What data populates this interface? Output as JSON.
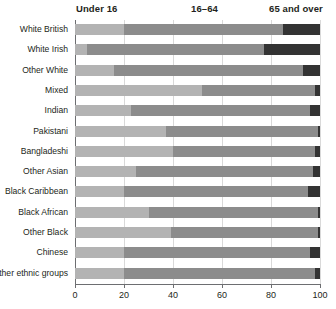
{
  "chart_data": {
    "type": "bar",
    "orientation": "horizontal",
    "stacked": true,
    "stacked_percent": true,
    "title": "",
    "xlabel": "",
    "ylabel": "",
    "xlim": [
      0,
      100
    ],
    "xticks": [
      0,
      20,
      40,
      60,
      80,
      100
    ],
    "xtick_labels": [
      "0",
      "20",
      "40",
      "60",
      "80",
      "100"
    ],
    "grid": true,
    "grid_axis": "x",
    "legend_position": "top",
    "group_headers": [
      "Under 16",
      "16–64",
      "65 and over"
    ],
    "categories": [
      "White British",
      "White Irish",
      "Other White",
      "Mixed",
      "Indian",
      "Pakistani",
      "Bangladeshi",
      "Other Asian",
      "Black Caribbean",
      "Black African",
      "Other Black",
      "Chinese",
      "Other ethnic groups"
    ],
    "series": [
      {
        "name": "Under 16",
        "color": "#b3b3b3",
        "values": [
          20,
          5,
          16,
          52,
          23,
          37,
          40,
          25,
          20,
          30,
          39,
          20,
          20
        ]
      },
      {
        "name": "16–64",
        "color": "#8c8c8c",
        "values": [
          65,
          72,
          77,
          46,
          73,
          62,
          58,
          72,
          75,
          69,
          60,
          76,
          78
        ]
      },
      {
        "name": "65 and over",
        "color": "#333333",
        "values": [
          15,
          23,
          7,
          2,
          4,
          1,
          2,
          3,
          5,
          1,
          1,
          4,
          2
        ]
      }
    ]
  },
  "colors": {
    "under16": "#b3b3b3",
    "working_age": "#8c8c8c",
    "over65": "#333333",
    "axis": "#6d6e71",
    "grid": "#d9d9d9",
    "text": "#231f20",
    "background": "#ffffff"
  }
}
